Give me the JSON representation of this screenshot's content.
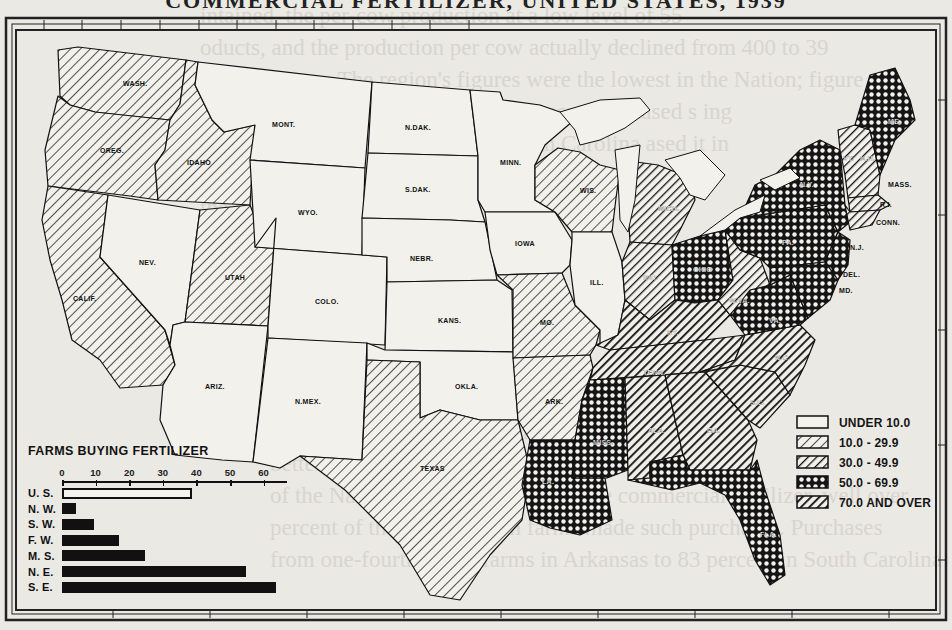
{
  "title": "COMMERCIAL FERTILIZER, UNITED STATES, 1939",
  "background_text_lines": [
    "intained, the per-cow production at a low level of 55",
    "oducts, and the production per cow actually declined from 400 to 39",
    "pounds a year. The region's figures were the lowest in the Nation; figure",
    "shows that in southern States few farmers purchased s   ing",
    "ing 1920, 69 percent of farms in South Carolina   ased it in",
    "     1940, 54.8 percent of   s in this",
    "   the South    only few  ch were",
    "  wned   feed. In the Southeast   es in Florida,",
    "however,   production enterprises",
    "drew a pr",
    "o Georgia                         ed as an inadequate feed-",
    "rate for the        ns that accompany livestock production",
    "entirely in     erosion and soil erosion, we",
    "would mo              these made much",
    "better                  ed with the proportion",
    "of the Nation's farms which purchase commercial fertilizer, well over",
    "percent of the Southeastern farms made such purchases. Purchases",
    "from one-fourth of the farms in Arkansas to 83 percent in South Carolina"
  ],
  "legend": {
    "items": [
      {
        "label": "UNDER 10.0",
        "class": "c0"
      },
      {
        "label": "10.0 - 29.9",
        "class": "c1"
      },
      {
        "label": "30.0 - 49.9",
        "class": "c2"
      },
      {
        "label": "50.0 - 69.9",
        "class": "c3"
      },
      {
        "label": "70.0 AND OVER",
        "class": "c4"
      }
    ]
  },
  "map": {
    "states": [
      {
        "abbr": "WASH.",
        "class": "c1"
      },
      {
        "abbr": "OREG.",
        "class": "c1"
      },
      {
        "abbr": "CALIF.",
        "class": "c1"
      },
      {
        "abbr": "IDAHO",
        "class": "c1"
      },
      {
        "abbr": "NEV.",
        "class": "c0"
      },
      {
        "abbr": "UTAH",
        "class": "c1"
      },
      {
        "abbr": "ARIZ.",
        "class": "c0"
      },
      {
        "abbr": "MONT.",
        "class": "c0"
      },
      {
        "abbr": "WYO.",
        "class": "c0"
      },
      {
        "abbr": "COLO.",
        "class": "c0"
      },
      {
        "abbr": "N.MEX.",
        "class": "c0"
      },
      {
        "abbr": "N.DAK.",
        "class": "c0"
      },
      {
        "abbr": "S.DAK.",
        "class": "c0"
      },
      {
        "abbr": "NEBR.",
        "class": "c0"
      },
      {
        "abbr": "KANS.",
        "class": "c0"
      },
      {
        "abbr": "OKLA.",
        "class": "c0"
      },
      {
        "abbr": "TEXAS",
        "class": "c1"
      },
      {
        "abbr": "MINN.",
        "class": "c0"
      },
      {
        "abbr": "IOWA",
        "class": "c0"
      },
      {
        "abbr": "MO.",
        "class": "c1"
      },
      {
        "abbr": "ARK.",
        "class": "c1"
      },
      {
        "abbr": "LA.",
        "class": "c3"
      },
      {
        "abbr": "WIS.",
        "class": "c1"
      },
      {
        "abbr": "ILL.",
        "class": "c0"
      },
      {
        "abbr": "MICH.",
        "class": "c2"
      },
      {
        "abbr": "IND.",
        "class": "c2"
      },
      {
        "abbr": "OHIO",
        "class": "c3"
      },
      {
        "abbr": "KY.",
        "class": "c4"
      },
      {
        "abbr": "TENN.",
        "class": "c4"
      },
      {
        "abbr": "MISS.",
        "class": "c3"
      },
      {
        "abbr": "ALA.",
        "class": "c4"
      },
      {
        "abbr": "GA.",
        "class": "c4"
      },
      {
        "abbr": "FLA.",
        "class": "c3"
      },
      {
        "abbr": "S.C.",
        "class": "c4"
      },
      {
        "abbr": "N.C.",
        "class": "c4"
      },
      {
        "abbr": "VA.",
        "class": "c3"
      },
      {
        "abbr": "W.VA.",
        "class": "c2"
      },
      {
        "abbr": "PA.",
        "class": "c3"
      },
      {
        "abbr": "N.Y.",
        "class": "c3"
      },
      {
        "abbr": "VT.",
        "class": "c2"
      },
      {
        "abbr": "N.H.",
        "class": "c2"
      },
      {
        "abbr": "ME.",
        "class": "c3"
      },
      {
        "abbr": "MASS.",
        "class": "c2"
      },
      {
        "abbr": "R.I.",
        "class": "c2"
      },
      {
        "abbr": "CONN.",
        "class": "c2"
      },
      {
        "abbr": "N.J.",
        "class": "c3"
      },
      {
        "abbr": "DEL.",
        "class": "c3"
      },
      {
        "abbr": "MD.",
        "class": "c3"
      }
    ]
  },
  "inset": {
    "title": "FARMS BUYING FERTILIZER",
    "axis_ticks": [
      "0",
      "10",
      "20",
      "30",
      "40",
      "50",
      "60"
    ]
  },
  "chart_data": {
    "type": "bar",
    "title": "FARMS BUYING FERTILIZER",
    "orientation": "horizontal",
    "categories": [
      "U. S.",
      "N. W.",
      "S. W.",
      "F. W.",
      "M. S.",
      "N. E.",
      "S. E."
    ],
    "values": [
      38.7,
      4.3,
      9.6,
      17.1,
      24.8,
      54.8,
      63.8
    ],
    "unit": "percent of farms",
    "xlim": [
      0,
      65
    ],
    "xticks": [
      0,
      10,
      20,
      30,
      40,
      50,
      60
    ],
    "highlight": {
      "U. S.": "outline"
    },
    "legend": [
      "UNDER 10.0",
      "10.0 - 29.9",
      "30.0 - 49.9",
      "50.0 - 69.9",
      "70.0 AND OVER"
    ]
  }
}
